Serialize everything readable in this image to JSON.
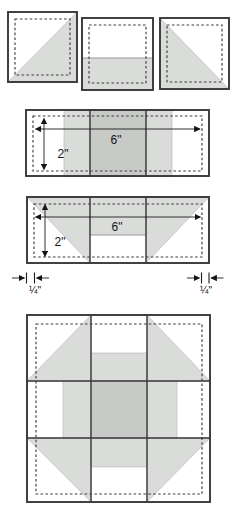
{
  "figure": {
    "name": "Quilt block piecing diagram",
    "colors": {
      "patch_fill_light": "#dadcda",
      "patch_fill_dark": "#c8cac8",
      "outline": "#383838",
      "seam_dash": "#3d3d3d",
      "background": "#ffffff"
    },
    "unit_row": {
      "items": [
        {
          "type": "half-square-triangle-unit",
          "gray_half": "lower-right"
        },
        {
          "type": "rectangle-unit",
          "gray_half": "bottom"
        },
        {
          "type": "half-square-triangle-unit",
          "gray_half": "lower-left"
        }
      ]
    },
    "strip_panel": {
      "width_label": "6\"",
      "height_label": "2\""
    },
    "pieced_strip_panel": {
      "width_label": "6\"",
      "height_label": "2\"",
      "seam_left_label": "¼\"",
      "seam_right_label": "¼\""
    },
    "block_panel": {
      "type": "assembled 3x3 quilt block"
    }
  }
}
